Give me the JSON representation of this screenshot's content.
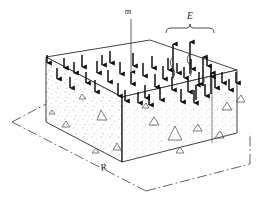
{
  "figure": {
    "name": "soil-block-water-balance-diagram",
    "type": "3d-block-diagram",
    "background_color": "#ffffff",
    "ink_color": "#1a1a1a",
    "stipple_color": "#b9b9b9",
    "labels": {
      "m": "m",
      "E": "E",
      "R": "R"
    },
    "annotations": {
      "m_description": "m",
      "E_description": "E",
      "R_description": "R"
    }
  },
  "geometry": {
    "top_face": [
      [
        46,
        57
      ],
      [
        150,
        40
      ],
      [
        237,
        70
      ],
      [
        122,
        97
      ]
    ],
    "front_face": [
      [
        46,
        57
      ],
      [
        122,
        97
      ],
      [
        122,
        162
      ],
      [
        46,
        122
      ]
    ],
    "right_face": [
      [
        122,
        97
      ],
      [
        237,
        70
      ],
      [
        237,
        133
      ],
      [
        122,
        162
      ]
    ],
    "right_inner_edge_x": 212,
    "right_inner_edge_y1": 79,
    "right_inner_edge_y2": 143
  },
  "dimension_lines": {
    "style": "dash-dot",
    "left": [
      [
        12,
        122
      ],
      [
        46,
        103
      ]
    ],
    "bottom_left": [
      [
        12,
        122
      ],
      [
        143,
        190
      ]
    ],
    "bottom_right": [
      [
        143,
        190
      ],
      [
        249,
        163
      ]
    ],
    "right": [
      [
        249,
        163
      ],
      [
        249,
        133
      ]
    ],
    "label": "R",
    "label_pos": [
      104,
      168
    ]
  },
  "m_leader": {
    "label_pos": [
      128,
      12
    ],
    "line_from": [
      131,
      18
    ],
    "line_to": [
      131,
      73
    ]
  },
  "E_bracket": {
    "label_pos": [
      190,
      14
    ],
    "left": 166,
    "right": 215,
    "y": 30,
    "tip_y": 23
  },
  "down_arrows": {
    "count": 41,
    "color": "#111111",
    "description": "downward infiltration arrows on top face"
  },
  "up_arrows": {
    "count": 5,
    "color": "#111111",
    "description": "upward evaporation arrows with wavy vapour trails"
  },
  "triangles": {
    "count": 14,
    "description": "aggregate particle outlines inside soil block"
  }
}
